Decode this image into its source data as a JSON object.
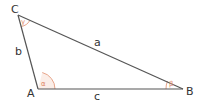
{
  "diagram": {
    "type": "triangle",
    "vertices": [
      {
        "name": "C",
        "x": 18,
        "y": 15
      },
      {
        "name": "A",
        "x": 38,
        "y": 89
      },
      {
        "name": "B",
        "x": 183,
        "y": 89
      }
    ],
    "sides": [
      {
        "name": "a",
        "from": "C",
        "to": "B"
      },
      {
        "name": "b",
        "from": "C",
        "to": "A"
      },
      {
        "name": "c",
        "from": "A",
        "to": "B"
      }
    ],
    "angles": [
      {
        "name": "α",
        "vertex": "A"
      },
      {
        "name": "β",
        "vertex": "B"
      },
      {
        "name": "γ",
        "vertex": "C"
      }
    ],
    "colors": {
      "line": "#555555",
      "angle_arc": "#e8a58a",
      "angle_fill": "#fbeee8",
      "angle_symbol": "#e08a6a"
    }
  }
}
